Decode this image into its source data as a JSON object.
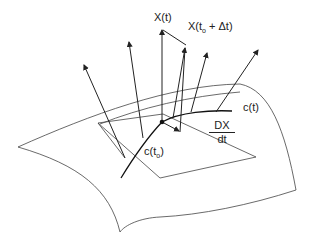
{
  "diagram": {
    "labels": {
      "x_t": "X(t)",
      "x_t0_dt_prefix": "X(t",
      "x_t0_dt_sub": "o",
      "x_t0_dt_suffix": " + Δt)",
      "c_t": "c(t)",
      "c_t0_prefix": "c(t",
      "c_t0_sub": "o",
      "c_t0_suffix": ")",
      "dx_num": "DX",
      "dx_den": "dt"
    },
    "elements": [
      "curved-surface",
      "tangent-plane",
      "curve-c",
      "normal-vectors",
      "vector-field-X",
      "derivative-arrow"
    ]
  }
}
